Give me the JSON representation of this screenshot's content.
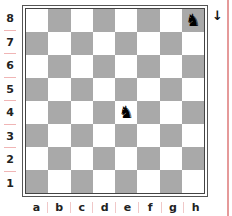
{
  "board": {
    "orientation": "white",
    "files": [
      "a",
      "b",
      "c",
      "d",
      "e",
      "f",
      "g",
      "h"
    ],
    "ranks": [
      "8",
      "7",
      "6",
      "5",
      "4",
      "3",
      "2",
      "1"
    ],
    "colors": {
      "light_square": "#ffffff",
      "dark_square": "#a9a9a9",
      "border": "#555555",
      "margin_line": "#e59a9a"
    },
    "pieces": [
      {
        "square": "h8",
        "type": "knight",
        "color": "black",
        "glyph": "♞"
      },
      {
        "square": "e4",
        "type": "knight",
        "color": "black",
        "glyph": "♞"
      }
    ]
  },
  "side_to_move": {
    "indicator": "↓",
    "icon": "down-arrow-icon",
    "meaning": "black"
  }
}
